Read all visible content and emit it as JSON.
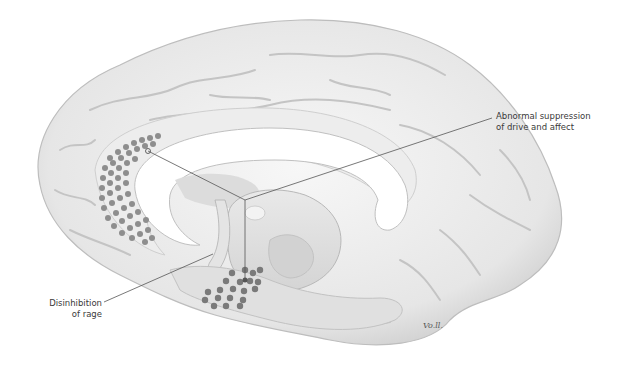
{
  "figure": {
    "labels": [
      {
        "id": "suppression",
        "lines": [
          "Abnormal suppression",
          "of drive and affect"
        ]
      },
      {
        "id": "rage",
        "lines": [
          "Disinhibition",
          "of rage"
        ]
      }
    ],
    "signature": "Vo.ll.",
    "colors": {
      "background": "#ffffff",
      "brain_surface": "#efefef",
      "brain_shadow": "#c8c8c8",
      "lesion_dots": "#8a8a8a",
      "leader_lines": "#555555",
      "text": "#3a3a3a"
    }
  }
}
